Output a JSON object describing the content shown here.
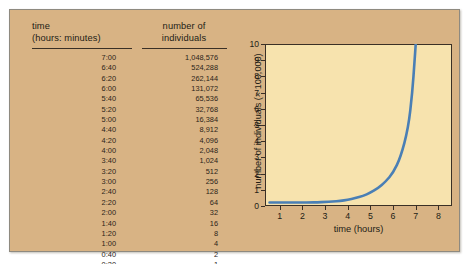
{
  "figure": {
    "card_bg": "#d8b384",
    "plot_bg": "#f7e3ae",
    "curve_color": "#4a7fb5",
    "axis_color": "#3a3026"
  },
  "table": {
    "headers": {
      "time_line1": "time",
      "time_line2": "(hours: minutes)",
      "count_line1": "number of",
      "count_line2": "individuals"
    },
    "rows": [
      {
        "time": "7:00",
        "count": "1,048,576"
      },
      {
        "time": "6:40",
        "count": "524,288"
      },
      {
        "time": "6:20",
        "count": "262,144"
      },
      {
        "time": "6:00",
        "count": "131,072"
      },
      {
        "time": "5:40",
        "count": "65,536"
      },
      {
        "time": "5:20",
        "count": "32,768"
      },
      {
        "time": "5:00",
        "count": "16,384"
      },
      {
        "time": "4:40",
        "count": "8,912"
      },
      {
        "time": "4:20",
        "count": "4,096"
      },
      {
        "time": "4:00",
        "count": "2,048"
      },
      {
        "time": "3:40",
        "count": "1,024"
      },
      {
        "time": "3:20",
        "count": "512"
      },
      {
        "time": "3:00",
        "count": "256"
      },
      {
        "time": "2:40",
        "count": "128"
      },
      {
        "time": "2:20",
        "count": "64"
      },
      {
        "time": "2:00",
        "count": "32"
      },
      {
        "time": "1:40",
        "count": "16"
      },
      {
        "time": "1:20",
        "count": "8"
      },
      {
        "time": "1:00",
        "count": "4"
      },
      {
        "time": "0:40",
        "count": "2"
      },
      {
        "time": "0:20",
        "count": "1"
      }
    ]
  },
  "chart_data": {
    "type": "line",
    "title": "",
    "xlabel": "time (hours)",
    "ylabel": "number of individuals (× 100,000)",
    "xlim": [
      0.35,
      8.6
    ],
    "ylim": [
      0,
      10
    ],
    "xticks": [
      1,
      2,
      3,
      4,
      5,
      6,
      7,
      8
    ],
    "yticks": [
      0,
      1,
      2,
      3,
      4,
      5,
      6,
      7,
      8,
      9,
      10
    ],
    "grid": false,
    "legend": null,
    "series": [
      {
        "name": "exponential population growth",
        "color": "#4a7fb5",
        "x": [
          0.55,
          1.0,
          1.33,
          1.67,
          2.0,
          2.33,
          2.67,
          3.0,
          3.33,
          3.67,
          4.0,
          4.33,
          4.67,
          5.0,
          5.33,
          5.67,
          6.0,
          6.33,
          6.67,
          6.85,
          6.95,
          7.0
        ],
        "y": [
          0.22,
          0.22,
          0.22,
          0.22,
          0.22,
          0.22,
          0.23,
          0.25,
          0.27,
          0.31,
          0.38,
          0.48,
          0.62,
          0.82,
          1.1,
          1.5,
          2.05,
          3.0,
          4.8,
          7.0,
          9.0,
          10.0
        ]
      }
    ]
  }
}
